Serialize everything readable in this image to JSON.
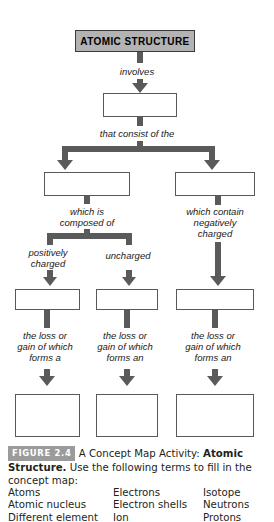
{
  "map": {
    "title_node": {
      "label": "ATOMIC STRUCTURE"
    },
    "connector_labels": {
      "involves": "involves",
      "that_consist_of_the": "that consist of the",
      "which_is_composed_of": "which is\ncomposed of",
      "which_contain_negatively_charged": "which contain\nnegatively\ncharged",
      "positively_charged": "positively\ncharged",
      "uncharged": "uncharged",
      "loss_or_gain_forms_a": "the loss or\ngain of which\nforms a",
      "loss_or_gain_forms_an_middle": "the loss or\ngain of which\nforms an",
      "loss_or_gain_forms_an_right": "the loss or\ngain of which\nforms an"
    },
    "blank_nodes": [
      {
        "id": "blank-1"
      },
      {
        "id": "blank-2-left"
      },
      {
        "id": "blank-2-right"
      },
      {
        "id": "blank-3-left"
      },
      {
        "id": "blank-3-middle"
      },
      {
        "id": "blank-3-right"
      },
      {
        "id": "blank-4-left"
      },
      {
        "id": "blank-4-middle"
      },
      {
        "id": "blank-4-right"
      }
    ]
  },
  "caption": {
    "figure_badge": "FIGURE 2.4",
    "text_part_1": " A Concept Map Activity: ",
    "text_bold": "Atomic Structure.",
    "text_part_2": " Use the following terms to fill in the concept map:"
  },
  "terms": {
    "column_1": [
      "Atoms",
      "Atomic nucleus",
      "Different element"
    ],
    "column_2": [
      "Electrons",
      "Electron shells",
      "Ion"
    ],
    "column_3": [
      "Isotope",
      "Neutrons",
      "Protons"
    ]
  },
  "colors": {
    "connector": "#5a5a5a",
    "title_box_fill": "#b3b3b3",
    "node_border": "#585858",
    "badge_fill": "#9b9b9b",
    "text": "#231f20"
  }
}
